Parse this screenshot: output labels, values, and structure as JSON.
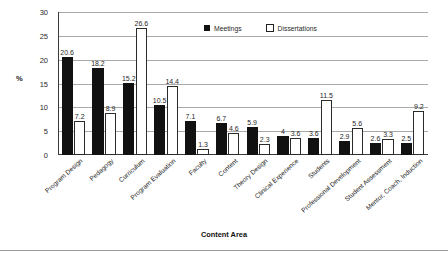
{
  "chart_data": {
    "type": "bar",
    "title": "",
    "xlabel": "Content Area",
    "ylabel": "%",
    "ylim": [
      0,
      30
    ],
    "yticks": [
      0,
      5,
      10,
      15,
      20,
      25,
      30
    ],
    "grid": true,
    "legend_position": "top-center",
    "categories": [
      "Program Design",
      "Pedagogy",
      "Curriculum",
      "Program Evaluation",
      "Faculty",
      "Content",
      "Theory Design",
      "Clinical Experience",
      "Students",
      "Professional Development",
      "Student Assessment",
      "Mentor, Coach, Induction"
    ],
    "series": [
      {
        "name": "Meetings",
        "color": "#111111",
        "values": [
          20.6,
          18.2,
          15.2,
          10.5,
          7.1,
          6.7,
          5.9,
          4,
          3.6,
          2.9,
          2.6,
          2.5
        ],
        "labels": [
          "20.6",
          "18.2",
          "15.2",
          "10.5",
          "7.1",
          "6.7",
          "5.9",
          "4",
          "3.6",
          "2.9",
          "2.6",
          "2.5"
        ]
      },
      {
        "name": "Dissertations",
        "color": "#ffffff",
        "values": [
          7.2,
          8.9,
          26.6,
          14.4,
          1.3,
          4.6,
          2.3,
          3.6,
          11.5,
          5.6,
          3.3,
          9.2
        ],
        "labels": [
          "7.2",
          "8.9",
          "26.6",
          "14.4",
          "1.3",
          "4.6",
          "2.3",
          "3.6",
          "11.5",
          "5.6",
          "3.3",
          "9.2"
        ]
      }
    ]
  },
  "legend": {
    "items": [
      {
        "label": "Meetings"
      },
      {
        "label": "Dissertations"
      }
    ]
  },
  "axes": {
    "y_title": "%",
    "x_title": "Content Area"
  }
}
